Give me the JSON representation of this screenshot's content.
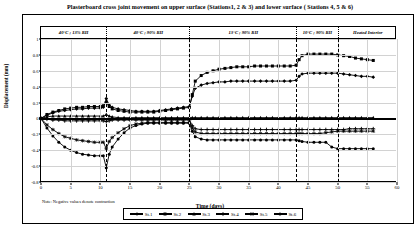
{
  "title": "Plasterboard cross joint movement on upper surface (Stations1, 2 & 3) and lower surface ( Stations 4, 5 & 6)",
  "note": "Note: Negative values denote contraction",
  "axes": {
    "ylabel": "Displacement (mm)",
    "xlabel": "Time (days)",
    "yticks": [
      "1",
      "0.8",
      "0.6",
      "0.4",
      "0.2",
      "0",
      "-0.2",
      "-0.4",
      "-0.6",
      "-0.8"
    ],
    "xticks": [
      "0",
      "5",
      "10",
      "15",
      "20",
      "25",
      "30",
      "35",
      "40",
      "45",
      "50",
      "55",
      "60"
    ]
  },
  "bands": [
    {
      "label": "40°C ; 13% RH",
      "start": 0,
      "end": 11
    },
    {
      "label": "40°C ; 90% RH",
      "start": 11,
      "end": 25
    },
    {
      "label": "13°C ; 90% RH",
      "start": 25,
      "end": 43
    },
    {
      "label": "10°C ; 90% RH",
      "start": 43,
      "end": 50
    },
    {
      "label": "Heated Interior",
      "start": 50,
      "end": 60
    }
  ],
  "legend": [
    {
      "label": "St.1",
      "marker": "diamond"
    },
    {
      "label": "St.2",
      "marker": "square"
    },
    {
      "label": "St.3",
      "marker": "triangle"
    },
    {
      "label": "St.4",
      "marker": "cross"
    },
    {
      "label": "St.5",
      "marker": "star"
    },
    {
      "label": "St.6",
      "marker": "circle"
    }
  ],
  "chart_data": {
    "type": "line",
    "title": "Plasterboard cross joint movement on upper surface (Stations1, 2 & 3) and lower surface ( Stations 4, 5 & 6)",
    "xlabel": "Time (days)",
    "ylabel": "Displacement (mm)",
    "xlim": [
      0,
      60
    ],
    "ylim": [
      -0.8,
      1.0
    ],
    "xticks": [
      0,
      5,
      10,
      15,
      20,
      25,
      30,
      35,
      40,
      45,
      50,
      55,
      60
    ],
    "yticks": [
      -0.8,
      -0.6,
      -0.4,
      -0.2,
      0,
      0.2,
      0.4,
      0.6,
      0.8,
      1.0
    ],
    "grid": true,
    "legend_position": "bottom",
    "annotations": [
      "40°C ; 13% RH (days 0-11)",
      "40°C ; 90% RH (days 11-25)",
      "13°C ; 90% RH (days 25-43)",
      "10°C ; 90% RH (days 43-50)",
      "Heated Interior (days 50-60)"
    ],
    "x": [
      0,
      1,
      2,
      3,
      4,
      5,
      6,
      7,
      8,
      9,
      10,
      10.5,
      11,
      11.5,
      12,
      13,
      14,
      15,
      16,
      17,
      18,
      19,
      20,
      21,
      22,
      23,
      24,
      25,
      25.5,
      26,
      27,
      28,
      29,
      30,
      31,
      32,
      33,
      34,
      35,
      36,
      37,
      38,
      39,
      40,
      41,
      42,
      43,
      43.5,
      44,
      45,
      46,
      47,
      48,
      49,
      50,
      51,
      52,
      53,
      54,
      55,
      56
    ],
    "series": [
      {
        "name": "St.1",
        "marker": "diamond",
        "values": [
          0,
          0.04,
          0.07,
          0.09,
          0.1,
          0.11,
          0.12,
          0.12,
          0.13,
          0.13,
          0.13,
          0.14,
          0.25,
          0.17,
          0.14,
          0.12,
          0.11,
          0.1,
          0.09,
          0.09,
          0.09,
          0.09,
          0.1,
          0.11,
          0.12,
          0.13,
          0.14,
          0.15,
          0.28,
          0.38,
          0.42,
          0.44,
          0.45,
          0.46,
          0.46,
          0.47,
          0.47,
          0.47,
          0.47,
          0.47,
          0.47,
          0.47,
          0.47,
          0.47,
          0.47,
          0.47,
          0.48,
          0.53,
          0.56,
          0.57,
          0.57,
          0.57,
          0.57,
          0.57,
          0.57,
          0.56,
          0.55,
          0.54,
          0.53,
          0.53,
          0.52
        ]
      },
      {
        "name": "St.2",
        "marker": "square",
        "values": [
          0,
          0.05,
          0.08,
          0.1,
          0.12,
          0.13,
          0.14,
          0.14,
          0.15,
          0.15,
          0.15,
          0.16,
          0.2,
          0.15,
          0.12,
          0.1,
          0.09,
          0.08,
          0.08,
          0.08,
          0.08,
          0.08,
          0.09,
          0.1,
          0.11,
          0.12,
          0.13,
          0.14,
          0.3,
          0.47,
          0.54,
          0.58,
          0.6,
          0.62,
          0.63,
          0.64,
          0.65,
          0.65,
          0.65,
          0.66,
          0.66,
          0.66,
          0.66,
          0.66,
          0.66,
          0.66,
          0.67,
          0.74,
          0.79,
          0.81,
          0.81,
          0.81,
          0.81,
          0.81,
          0.8,
          0.79,
          0.78,
          0.76,
          0.75,
          0.74,
          0.73
        ]
      },
      {
        "name": "St.3",
        "marker": "triangle",
        "values": [
          0,
          0.02,
          0.03,
          0.03,
          0.03,
          0.03,
          0.03,
          0.03,
          0.03,
          0.03,
          0.03,
          0.03,
          0.05,
          0.03,
          0.02,
          0.01,
          0.01,
          0.01,
          0.01,
          0.01,
          0.01,
          0.01,
          0.01,
          0.01,
          0.01,
          0.01,
          0.01,
          0.01,
          0.01,
          0.01,
          0.01,
          0.01,
          0.01,
          0.01,
          0.01,
          0.01,
          0.01,
          0.01,
          0.01,
          0.01,
          0.01,
          0.01,
          0.01,
          0.01,
          0.01,
          0.01,
          0.01,
          0.01,
          0.01,
          0.01,
          0.01,
          0.01,
          0.01,
          0.01,
          0.01,
          0.01,
          0.01,
          0.01,
          0.01,
          0.01,
          0.01
        ]
      },
      {
        "name": "St.4",
        "marker": "cross",
        "values": [
          0,
          -0.01,
          -0.02,
          -0.02,
          -0.03,
          -0.03,
          -0.03,
          -0.03,
          -0.03,
          -0.03,
          -0.03,
          -0.03,
          -0.04,
          -0.03,
          -0.02,
          -0.02,
          -0.02,
          -0.02,
          -0.02,
          -0.02,
          -0.02,
          -0.02,
          -0.02,
          -0.02,
          -0.02,
          -0.02,
          -0.02,
          -0.02,
          -0.09,
          -0.13,
          -0.14,
          -0.14,
          -0.14,
          -0.14,
          -0.14,
          -0.14,
          -0.14,
          -0.14,
          -0.14,
          -0.14,
          -0.14,
          -0.14,
          -0.14,
          -0.14,
          -0.14,
          -0.14,
          -0.14,
          -0.14,
          -0.14,
          -0.14,
          -0.14,
          -0.14,
          -0.14,
          -0.14,
          -0.14,
          -0.14,
          -0.13,
          -0.13,
          -0.13,
          -0.13,
          -0.13
        ]
      },
      {
        "name": "St.5",
        "marker": "star",
        "values": [
          0,
          -0.08,
          -0.14,
          -0.19,
          -0.23,
          -0.25,
          -0.27,
          -0.28,
          -0.29,
          -0.3,
          -0.3,
          -0.3,
          -0.38,
          -0.29,
          -0.24,
          -0.18,
          -0.13,
          -0.09,
          -0.07,
          -0.06,
          -0.05,
          -0.05,
          -0.05,
          -0.05,
          -0.05,
          -0.05,
          -0.05,
          -0.05,
          -0.12,
          -0.17,
          -0.19,
          -0.19,
          -0.19,
          -0.19,
          -0.19,
          -0.19,
          -0.19,
          -0.19,
          -0.19,
          -0.19,
          -0.19,
          -0.19,
          -0.19,
          -0.19,
          -0.19,
          -0.19,
          -0.19,
          -0.19,
          -0.19,
          -0.19,
          -0.19,
          -0.19,
          -0.18,
          -0.17,
          -0.16,
          -0.16,
          -0.16,
          -0.16,
          -0.16,
          -0.16,
          -0.16
        ]
      },
      {
        "name": "St.6",
        "marker": "circle",
        "values": [
          0,
          -0.12,
          -0.22,
          -0.3,
          -0.36,
          -0.4,
          -0.43,
          -0.45,
          -0.46,
          -0.47,
          -0.47,
          -0.47,
          -0.62,
          -0.45,
          -0.36,
          -0.26,
          -0.18,
          -0.12,
          -0.09,
          -0.07,
          -0.06,
          -0.06,
          -0.06,
          -0.06,
          -0.06,
          -0.06,
          -0.06,
          -0.06,
          -0.16,
          -0.23,
          -0.26,
          -0.27,
          -0.27,
          -0.27,
          -0.27,
          -0.27,
          -0.27,
          -0.27,
          -0.27,
          -0.27,
          -0.27,
          -0.27,
          -0.27,
          -0.27,
          -0.27,
          -0.27,
          -0.27,
          -0.28,
          -0.29,
          -0.3,
          -0.3,
          -0.3,
          -0.3,
          -0.36,
          -0.38,
          -0.38,
          -0.38,
          -0.38,
          -0.38,
          -0.38,
          -0.38
        ]
      }
    ]
  }
}
